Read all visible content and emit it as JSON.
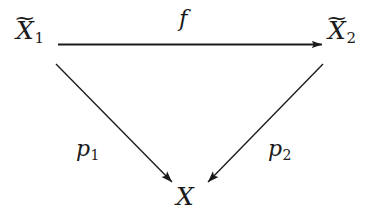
{
  "diagram": {
    "kind": "commutative-triangle",
    "background_color": "#ffffff",
    "ink_color": "#1a1a1a",
    "nodes": [
      {
        "id": "xt1",
        "name": "source-object-x-tilde-1",
        "base": "X",
        "accent": "~",
        "subscript": "1",
        "plain_text": "X̃1",
        "position": "top-left"
      },
      {
        "id": "xt2",
        "name": "target-object-x-tilde-2",
        "base": "X",
        "accent": "~",
        "subscript": "2",
        "plain_text": "X̃2",
        "position": "top-right"
      },
      {
        "id": "x",
        "name": "base-object-x",
        "base": "X",
        "accent": "",
        "subscript": "",
        "plain_text": "X",
        "position": "bottom-center"
      }
    ],
    "edges": [
      {
        "id": "f",
        "name": "morphism-f",
        "from": "xt1",
        "to": "xt2",
        "label": "f",
        "subscript": "",
        "style": "solid",
        "orientation": "horizontal",
        "arrowhead": "filled-triangle"
      },
      {
        "id": "p1",
        "name": "projection-p-1",
        "from": "xt1",
        "to": "x",
        "label": "p",
        "subscript": "1",
        "style": "solid",
        "orientation": "diagonal-down-right",
        "arrowhead": "filled-triangle"
      },
      {
        "id": "p2",
        "name": "projection-p-2",
        "from": "xt2",
        "to": "x",
        "label": "p",
        "subscript": "2",
        "style": "solid",
        "orientation": "diagonal-down-left",
        "arrowhead": "filled-triangle"
      }
    ]
  }
}
